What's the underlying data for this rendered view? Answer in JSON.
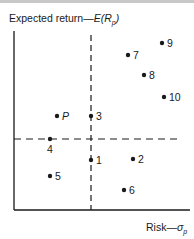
{
  "diagram": {
    "y_axis_label_prefix": "Expected return—",
    "y_axis_label_func": "E(R",
    "y_axis_label_sub": "p",
    "y_axis_label_close": ")",
    "x_axis_label_prefix": "Risk—",
    "x_axis_label_sym": "σ",
    "x_axis_label_sub": "p"
  },
  "chart_data": {
    "type": "scatter",
    "title": "",
    "xlabel": "Risk—σp",
    "ylabel": "Expected return—E(Rp)",
    "reference_lines": {
      "vertical_dashed_through": "P risk level (points 3, 1)",
      "horizontal_dashed_through": "P return level (point 4)"
    },
    "points": [
      {
        "label": "P",
        "x": 57,
        "y": 116
      },
      {
        "label": "1",
        "x": 91,
        "y": 160
      },
      {
        "label": "2",
        "x": 133,
        "y": 159
      },
      {
        "label": "3",
        "x": 91,
        "y": 116
      },
      {
        "label": "4",
        "x": 50,
        "y": 139
      },
      {
        "label": "5",
        "x": 50,
        "y": 176
      },
      {
        "label": "6",
        "x": 124,
        "y": 190
      },
      {
        "label": "7",
        "x": 128,
        "y": 55
      },
      {
        "label": "8",
        "x": 144,
        "y": 75
      },
      {
        "label": "9",
        "x": 162,
        "y": 43
      },
      {
        "label": "10",
        "x": 164,
        "y": 97
      }
    ]
  }
}
